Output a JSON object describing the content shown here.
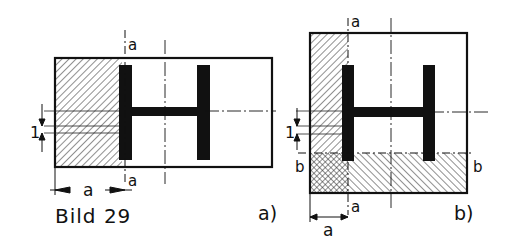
{
  "caption": "Bild 29",
  "figures": [
    {
      "id": "a",
      "label": "a)",
      "section_line_label_top": "a",
      "section_line_label_bottom": "a",
      "dimension_width_label": "a",
      "dimension_thickness_label": "1"
    },
    {
      "id": "b",
      "label": "b)",
      "section_line_label_top": "a",
      "section_line_label_bottom": "a",
      "section_line_b_left": "b",
      "section_line_b_right": "b",
      "dimension_width_label": "a",
      "dimension_thickness_label": "1"
    }
  ],
  "colors": {
    "ink": "#111111",
    "paper": "#ffffff"
  }
}
